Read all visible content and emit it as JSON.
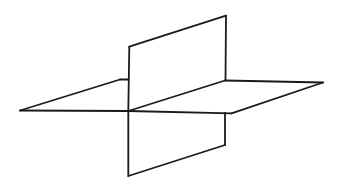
{
  "diagram": {
    "title": "",
    "style": {
      "stroke_color": "#1a1a1a",
      "stroke_width": 1.8,
      "background": "#ffffff"
    },
    "horizontal_plane": {
      "name": "horizontal-plane",
      "vertices": {
        "left_tip": [
          20,
          110.5
        ],
        "back_left": [
          120,
          79.5
        ],
        "back_right": [
          225,
          80.5
        ],
        "right_tip": [
          323,
          82.5
        ],
        "front_right": [
          231.5,
          113.3
        ],
        "intersection_front": [
          128.3,
          111
        ]
      }
    },
    "vertical_plane": {
      "name": "vertical-plane",
      "vertices": {
        "top_left": [
          130,
          46.7
        ],
        "top_right": [
          226,
          15.7
        ],
        "mid_right_back": [
          225,
          80.5
        ],
        "intersection_front": [
          128.3,
          111
        ],
        "right_lower_top": [
          225,
          113
        ],
        "bottom_right": [
          225,
          145
        ],
        "bottom_left": [
          128.3,
          176
        ]
      }
    },
    "segments": [
      {
        "id": "h-front-left",
        "from": [
          20,
          110.5
        ],
        "to": [
          128.3,
          111
        ]
      },
      {
        "id": "h-front-right",
        "from": [
          128.3,
          111
        ],
        "to": [
          231.5,
          113.3
        ]
      },
      {
        "id": "h-left-edge",
        "from": [
          20,
          110.5
        ],
        "to": [
          120,
          79.5
        ]
      },
      {
        "id": "h-back-left-stub",
        "from": [
          120,
          79.5
        ],
        "to": [
          128.3,
          79.5
        ]
      },
      {
        "id": "h-back-right",
        "from": [
          225,
          80.5
        ],
        "to": [
          323,
          82.5
        ]
      },
      {
        "id": "h-right-edge",
        "from": [
          323,
          82.5
        ],
        "to": [
          231.5,
          113.3
        ]
      },
      {
        "id": "intersection-line",
        "from": [
          128.3,
          111
        ],
        "to": [
          225,
          80.5
        ]
      },
      {
        "id": "v-top-edge",
        "from": [
          129.3,
          46.7
        ],
        "to": [
          226,
          15.7
        ]
      },
      {
        "id": "v-upper-right-edge",
        "from": [
          226,
          15.7
        ],
        "to": [
          225.5,
          80.5
        ]
      },
      {
        "id": "v-left-edge-upper",
        "from": [
          129.3,
          46.7
        ],
        "to": [
          128.3,
          111
        ]
      },
      {
        "id": "v-left-edge-lower",
        "from": [
          128.3,
          111
        ],
        "to": [
          128.3,
          176
        ]
      },
      {
        "id": "v-bottom-edge",
        "from": [
          128.3,
          176
        ],
        "to": [
          225,
          145
        ]
      },
      {
        "id": "v-lower-right-edge",
        "from": [
          225,
          145
        ],
        "to": [
          225,
          113
        ]
      }
    ]
  }
}
